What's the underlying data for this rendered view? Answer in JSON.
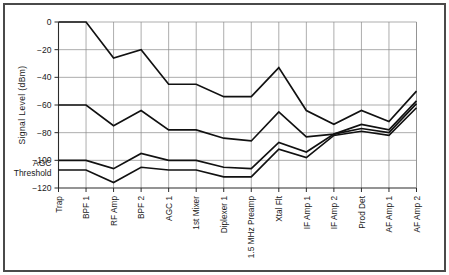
{
  "chart_data": {
    "type": "line",
    "title": "",
    "xlabel": "",
    "ylabel": "Signal Level (dBm)",
    "ylim": [
      -120,
      0
    ],
    "yticks": [
      0,
      -20,
      -40,
      -60,
      -80,
      -100,
      -120
    ],
    "ytick_labels": [
      "0",
      "-20",
      "-40",
      "-60",
      "-80",
      "-100",
      "-120"
    ],
    "grid": true,
    "legend": "none",
    "categories": [
      "Trap",
      "BPF 1",
      "RF Amp",
      "BPF 2",
      "AGC 1",
      "1st Mixer",
      "Diplexer 1",
      "1.5 MHz Preamp",
      "Xtal Flt",
      "IF Amp 1",
      "IF Amp 2",
      "Prod Det",
      "AF Amp 1",
      "AF Amp 2"
    ],
    "series": [
      {
        "name": "Strong signal level",
        "values": [
          0,
          0,
          -26,
          -20,
          -45,
          -45,
          -54,
          -54,
          -33,
          -64,
          -74,
          -64,
          -72,
          -50
        ]
      },
      {
        "name": "Medium signal level",
        "values": [
          -60,
          -60,
          -75,
          -64,
          -78,
          -78,
          -84,
          -86,
          -65,
          -83,
          -81,
          -74,
          -78,
          -57
        ]
      },
      {
        "name": "Weak signal level",
        "values": [
          -100,
          -100,
          -106,
          -95,
          -100,
          -100,
          -105,
          -106,
          -87,
          -94,
          -81,
          -77,
          -80,
          -59
        ]
      },
      {
        "name": "AGC threshold signal level",
        "values": [
          -107,
          -107,
          -116,
          -105,
          -107,
          -107,
          -112,
          -112,
          -92,
          -98,
          -82,
          -79,
          -82,
          -62
        ]
      }
    ],
    "annotations": [
      {
        "name": "agc-threshold-label",
        "line1": "AGC",
        "line2": "Threshold",
        "value": -107
      }
    ],
    "colors": {
      "series_stroke": "#111111",
      "grid": "#8a8a8a",
      "axis": "#2b2b2b",
      "frame": "#4a4a4a",
      "background": "#ffffff"
    }
  }
}
